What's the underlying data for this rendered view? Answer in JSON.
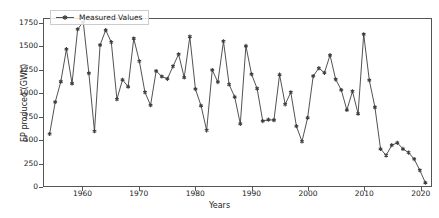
{
  "chart_data": {
    "type": "line",
    "title": "",
    "xlabel": "Years",
    "ylabel": "EP produced (GWh)",
    "xlim": [
      1953,
      2022
    ],
    "ylim": [
      0,
      1800
    ],
    "xticks": [
      1960,
      1970,
      1980,
      1990,
      2000,
      2010,
      2020
    ],
    "yticks": [
      0,
      250,
      500,
      750,
      1000,
      1250,
      1500,
      1750
    ],
    "grid": false,
    "legend_position": "upper left",
    "series": [
      {
        "name": "Measured Values",
        "color": "#3d3d3d",
        "marker": "star",
        "x": [
          1954,
          1955,
          1956,
          1957,
          1958,
          1959,
          1960,
          1961,
          1962,
          1963,
          1964,
          1965,
          1966,
          1967,
          1968,
          1969,
          1970,
          1971,
          1972,
          1973,
          1974,
          1975,
          1976,
          1977,
          1978,
          1979,
          1980,
          1981,
          1982,
          1983,
          1984,
          1985,
          1986,
          1987,
          1988,
          1989,
          1990,
          1991,
          1992,
          1993,
          1994,
          1995,
          1996,
          1997,
          1998,
          1999,
          2000,
          2001,
          2002,
          2003,
          2004,
          2005,
          2006,
          2007,
          2008,
          2009,
          2010,
          2011,
          2012,
          2013,
          2014,
          2015,
          2016,
          2017,
          2018,
          2019,
          2020,
          2021
        ],
        "values": [
          560,
          905,
          1125,
          1475,
          1105,
          1690,
          1770,
          1215,
          590,
          1520,
          1680,
          1550,
          935,
          1145,
          1070,
          1590,
          1345,
          1010,
          870,
          1240,
          1180,
          1155,
          1290,
          1420,
          1170,
          1610,
          1045,
          865,
          600,
          1250,
          1120,
          1560,
          1095,
          960,
          670,
          1510,
          1205,
          1050,
          700,
          715,
          710,
          1200,
          880,
          1010,
          645,
          480,
          735,
          1185,
          1270,
          1220,
          1410,
          1150,
          1035,
          820,
          1020,
          780,
          1635,
          1140,
          850,
          400,
          330,
          440,
          465,
          400,
          360,
          290,
          170,
          35
        ]
      }
    ]
  },
  "legend": {
    "label": "Measured Values"
  },
  "axes": {
    "y_tick_labels": [
      "1750",
      "1500",
      "1250",
      "1000",
      "750",
      "500",
      "250",
      "0"
    ],
    "x_tick_labels": [
      "1960",
      "1970",
      "1980",
      "1990",
      "2000",
      "2010",
      "2020"
    ]
  }
}
